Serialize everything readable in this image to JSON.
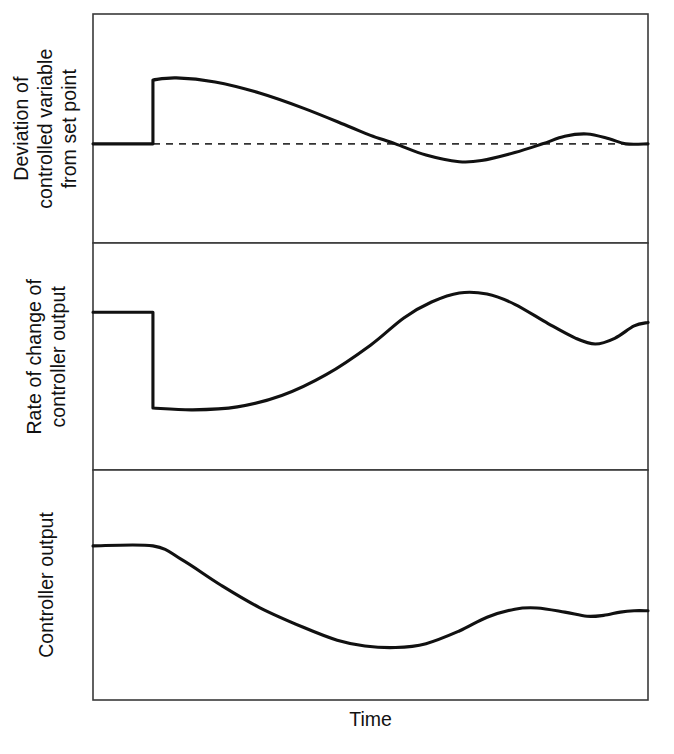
{
  "figure": {
    "type": "multi-panel-time-response-diagram",
    "panel_count": 3,
    "xlabel": "Time",
    "frame_color": "#3a3a3a",
    "curve_color": "#111111",
    "setpoint_line_color": "#333333",
    "background": "#ffffff"
  },
  "panels": [
    {
      "id": "deviation",
      "ylabel_lines": [
        "Deviation of",
        "controlled variable",
        "from set point"
      ],
      "ylabel": "Deviation of controlled variable from set point",
      "has_setpoint_dashed_line": true,
      "setpoint_label": "set point (dashed reference line)"
    },
    {
      "id": "rate-of-change",
      "ylabel_lines": [
        "Rate of change of",
        "controller output"
      ],
      "ylabel": "Rate of change of controller output",
      "has_setpoint_dashed_line": false
    },
    {
      "id": "controller-output",
      "ylabel_lines": [
        "Controller output"
      ],
      "ylabel": "Controller output",
      "has_setpoint_dashed_line": false
    }
  ],
  "chart_data": {
    "type": "line",
    "title": "",
    "xlabel": "Time",
    "ylabel": "",
    "grid": false,
    "legend": null,
    "axis_ticks": {
      "x": [],
      "y": []
    },
    "note": "Three stacked time-response panels sharing a common Time axis; no numeric tick labels are printed on the figure. Values below are read off in pixel-relative units of each panel box (x: 0 at left frame, 1 at right frame; y: 0 at panel top, 1 at panel bottom).",
    "panels": [
      {
        "name": "Deviation of controlled variable from set point",
        "xlim": [
          0,
          1
        ],
        "ylim": [
          0,
          1
        ],
        "reference_line": {
          "style": "dashed",
          "y": 0.567
        },
        "series": [
          {
            "name": "deviation",
            "style": "solid",
            "points": [
              [
                0.0,
                0.567
              ],
              [
                0.108,
                0.567
              ],
              [
                0.108,
                0.288
              ],
              [
                0.15,
                0.279
              ],
              [
                0.22,
                0.297
              ],
              [
                0.3,
                0.345
              ],
              [
                0.38,
                0.412
              ],
              [
                0.46,
                0.49
              ],
              [
                0.5,
                0.53
              ],
              [
                0.545,
                0.567
              ],
              [
                0.6,
                0.616
              ],
              [
                0.66,
                0.645
              ],
              [
                0.7,
                0.64
              ],
              [
                0.76,
                0.605
              ],
              [
                0.81,
                0.567
              ],
              [
                0.85,
                0.534
              ],
              [
                0.89,
                0.524
              ],
              [
                0.93,
                0.545
              ],
              [
                0.96,
                0.567
              ],
              [
                1.0,
                0.567
              ]
            ]
          }
        ]
      },
      {
        "name": "Rate of change of controller output",
        "xlim": [
          0,
          1
        ],
        "ylim": [
          0,
          1
        ],
        "series": [
          {
            "name": "rate-of-change",
            "style": "solid",
            "points": [
              [
                0.0,
                0.305
              ],
              [
                0.108,
                0.305
              ],
              [
                0.108,
                0.727
              ],
              [
                0.18,
                0.735
              ],
              [
                0.26,
                0.722
              ],
              [
                0.34,
                0.672
              ],
              [
                0.42,
                0.58
              ],
              [
                0.5,
                0.45
              ],
              [
                0.56,
                0.33
              ],
              [
                0.61,
                0.26
              ],
              [
                0.66,
                0.22
              ],
              [
                0.71,
                0.225
              ],
              [
                0.76,
                0.27
              ],
              [
                0.82,
                0.355
              ],
              [
                0.87,
                0.42
              ],
              [
                0.905,
                0.445
              ],
              [
                0.94,
                0.42
              ],
              [
                0.975,
                0.365
              ],
              [
                1.0,
                0.35
              ]
            ]
          }
        ]
      },
      {
        "name": "Controller output",
        "xlim": [
          0,
          1
        ],
        "ylim": [
          0,
          1
        ],
        "series": [
          {
            "name": "controller-output",
            "style": "solid",
            "points": [
              [
                0.0,
                0.33
              ],
              [
                0.108,
                0.33
              ],
              [
                0.16,
                0.39
              ],
              [
                0.23,
                0.5
              ],
              [
                0.3,
                0.598
              ],
              [
                0.38,
                0.685
              ],
              [
                0.44,
                0.74
              ],
              [
                0.49,
                0.765
              ],
              [
                0.545,
                0.772
              ],
              [
                0.6,
                0.755
              ],
              [
                0.66,
                0.7
              ],
              [
                0.71,
                0.64
              ],
              [
                0.76,
                0.605
              ],
              [
                0.8,
                0.6
              ],
              [
                0.85,
                0.618
              ],
              [
                0.89,
                0.636
              ],
              [
                0.92,
                0.632
              ],
              [
                0.95,
                0.618
              ],
              [
                0.975,
                0.612
              ],
              [
                1.0,
                0.612
              ]
            ]
          }
        ]
      }
    ]
  }
}
